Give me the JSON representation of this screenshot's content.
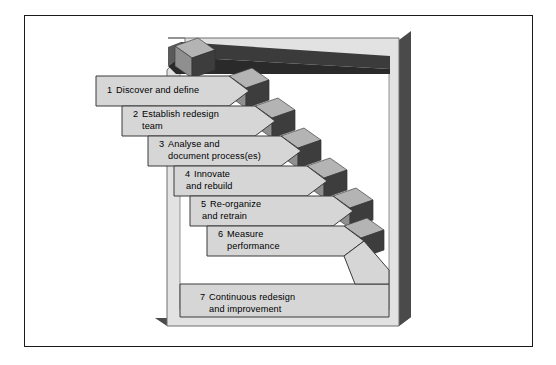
{
  "diagram": {
    "type": "staircase-steps",
    "frame": {
      "border_color": "#1a1a1a",
      "background": "#ffffff"
    },
    "colors": {
      "bar_face": "#d6d6d6",
      "bar_edge": "#3a3a3a",
      "block_top": "#b4b4b4",
      "block_front": "#8f8f8f",
      "block_side": "#3d3d3d",
      "slab_face": "#e2e2e2",
      "slab_edge": "#6e6e6e",
      "slab_shadow": "#4a4a4a",
      "top_bar": "#3b3b3b",
      "text": "#000000"
    },
    "steps": [
      {
        "number": "1",
        "line1": "Discover and define",
        "line2": ""
      },
      {
        "number": "2",
        "line1": "Establish redesign",
        "line2": "team"
      },
      {
        "number": "3",
        "line1": "Analyse and",
        "line2": "document process(es)"
      },
      {
        "number": "4",
        "line1": "Innovate",
        "line2": "and rebuild"
      },
      {
        "number": "5",
        "line1": "Re-organize",
        "line2": "and retrain"
      },
      {
        "number": "6",
        "line1": "Measure",
        "line2": "performance"
      },
      {
        "number": "7",
        "line1": "Continuous redesign",
        "line2": "and improvement"
      }
    ]
  }
}
